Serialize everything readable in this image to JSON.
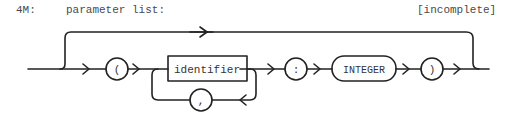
{
  "header": {
    "rule_id": "4M:",
    "rule_name": "parameter list:",
    "status": "[incomplete]"
  },
  "diagram": {
    "type": "syntax railroad diagram",
    "nodes": [
      {
        "kind": "terminal-circle",
        "label": "("
      },
      {
        "kind": "nonterminal-box",
        "label": "identifier"
      },
      {
        "kind": "terminal-circle",
        "label": ","
      },
      {
        "kind": "terminal-circle",
        "label": ":"
      },
      {
        "kind": "terminal-rounded",
        "label": "INTEGER"
      },
      {
        "kind": "terminal-circle",
        "label": ")"
      }
    ],
    "bypass": "optional — whole parameter list may be skipped",
    "loop": "identifier may repeat separated by ','"
  }
}
